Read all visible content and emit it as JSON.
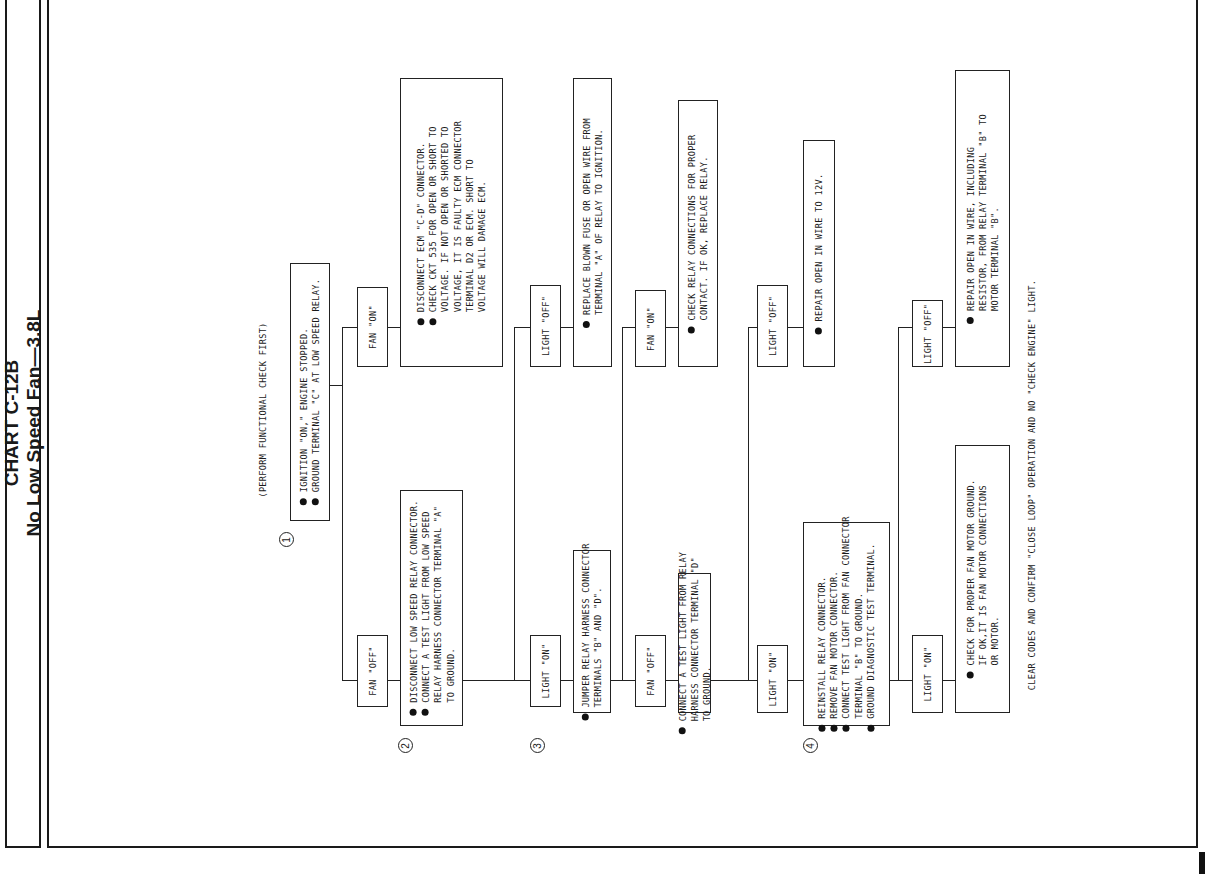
{
  "title": {
    "chart_id": "CHART C-12B",
    "subtitle": "No Low Speed Fan—3.8L"
  },
  "preamble": "(PERFORM FUNCTIONAL CHECK FIRST)",
  "steps": [
    {
      "number": "1",
      "lines": [
        {
          "bullet": true,
          "text": "IGNITION \"ON,\" ENGINE STOPPED."
        },
        {
          "bullet": true,
          "text": "GROUND TERMINAL \"C\" AT LOW SPEED RELAY."
        }
      ]
    },
    {
      "number": "2",
      "lines": [
        {
          "bullet": true,
          "text": "DISCONNECT LOW SPEED RELAY CONNECTOR."
        },
        {
          "bullet": true,
          "text": "CONNECT A TEST LIGHT FROM LOW SPEED"
        },
        {
          "bullet": false,
          "text": "RELAY HARNESS CONNECTOR TERMINAL \"A\""
        },
        {
          "bullet": false,
          "text": "TO GROUND."
        }
      ]
    },
    {
      "number": "3",
      "lines": [
        {
          "bullet": true,
          "text": "JUMPER RELAY HARNESS CONNECTOR"
        },
        {
          "bullet": false,
          "text": "TERMINALS \"B\" AND \"D\"."
        }
      ]
    },
    {
      "number": "",
      "lines": [
        {
          "bullet": true,
          "text": "CONNECT A TEST LIGHT FROM RELAY"
        },
        {
          "bullet": false,
          "text": "HARNESS CONNECTOR TERMINAL \"D\""
        },
        {
          "bullet": false,
          "text": "TO GROUND."
        }
      ]
    },
    {
      "number": "4",
      "lines": [
        {
          "bullet": true,
          "text": "REINSTALL RELAY CONNECTOR."
        },
        {
          "bullet": true,
          "text": "REMOVE FAN MOTOR CONNECTOR."
        },
        {
          "bullet": true,
          "text": "CONNECT TEST LIGHT FROM FAN CONNECTOR"
        },
        {
          "bullet": false,
          "text": "TERMINAL \"B\" TO GROUND."
        },
        {
          "bullet": true,
          "text": "GROUND DIAGNOSTIC TEST TERMINAL."
        }
      ]
    }
  ],
  "outcomes": {
    "fan_on_1": {
      "lines": [
        {
          "bullet": true,
          "text": "DISCONNECT ECM \"C-D\" CONNECTOR."
        },
        {
          "bullet": true,
          "text": "CHECK CKT 535 FOR OPEN OR SHORT TO"
        },
        {
          "bullet": false,
          "text": "VOLTAGE.  IF NOT OPEN OR SHORTED TO"
        },
        {
          "bullet": false,
          "text": "VOLTAGE, IT IS FAULTY ECM CONNECTOR"
        },
        {
          "bullet": false,
          "text": "TERMINAL D2 OR ECM.  SHORT TO"
        },
        {
          "bullet": false,
          "text": "VOLTAGE WILL DAMAGE ECM."
        }
      ]
    },
    "light_off_2": {
      "lines": [
        {
          "bullet": true,
          "text": "REPLACE BLOWN FUSE OR OPEN WIRE FROM"
        },
        {
          "bullet": false,
          "text": "TERMINAL \"A\" OF RELAY TO IGNITION."
        }
      ]
    },
    "fan_on_3": {
      "lines": [
        {
          "bullet": true,
          "text": "CHECK RELAY CONNECTIONS FOR PROPER"
        },
        {
          "bullet": false,
          "text": "CONTACT.  IF OK, REPLACE RELAY."
        }
      ]
    },
    "light_off_4": {
      "lines": [
        {
          "bullet": true,
          "text": "REPAIR OPEN IN WIRE TO 12V."
        }
      ]
    },
    "light_on_5": {
      "lines": [
        {
          "bullet": true,
          "text": "CHECK FOR PROPER FAN MOTOR GROUND."
        },
        {
          "bullet": false,
          "text": "IF OK,IT IS FAN MOTOR CONNECTIONS"
        },
        {
          "bullet": false,
          "text": "OR MOTOR."
        }
      ]
    },
    "light_off_5": {
      "lines": [
        {
          "bullet": true,
          "text": "REPAIR OPEN IN WIRE, INCLUDING"
        },
        {
          "bullet": false,
          "text": "RESISTOR, FROM RELAY TERMINAL \"B\" TO"
        },
        {
          "bullet": false,
          "text": "MOTOR TERMINAL \"B\"."
        }
      ]
    }
  },
  "branch_labels": {
    "fan_off": "FAN \"OFF\"",
    "fan_on": "FAN \"ON\"",
    "light_on": "LIGHT \"ON\"",
    "light_off": "LIGHT \"OFF\""
  },
  "footer": "CLEAR CODES AND CONFIRM \"CLOSE LOOP\" OPERATION AND NO \"CHECK ENGINE\" LIGHT.",
  "colors": {
    "ink": "#1a1a1a",
    "paper": "#ffffff"
  }
}
